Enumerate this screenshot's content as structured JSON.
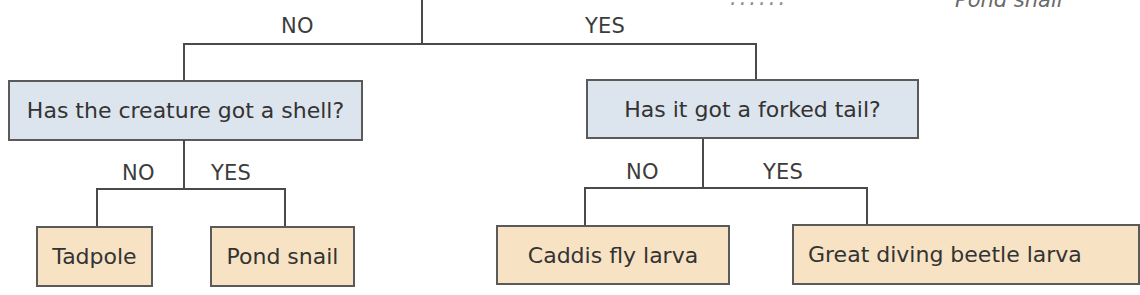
{
  "diagram": {
    "type": "identification-key",
    "top_branch": {
      "no_label": "NO",
      "yes_label": "YES"
    },
    "questions": [
      {
        "id": "shell",
        "text": "Has the creature got a shell?",
        "no_label": "NO",
        "yes_label": "YES",
        "no_result": "Tadpole",
        "yes_result": "Pond snail"
      },
      {
        "id": "forked-tail",
        "text": "Has it got a forked tail?",
        "no_label": "NO",
        "yes_label": "YES",
        "no_result": "Caddis fly larva",
        "yes_result": "Great diving beetle larva"
      }
    ],
    "caption_top_right": "Pond snail",
    "caption_partial": "......"
  },
  "colors": {
    "question_fill": "#dce4ee",
    "leaf_fill": "#f7e3c4",
    "line": "#4a4a4a"
  }
}
